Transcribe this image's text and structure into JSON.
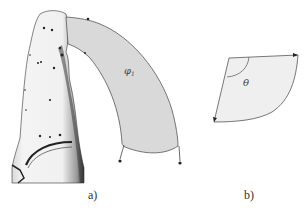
{
  "figure": {
    "panels": [
      {
        "id": "a",
        "caption": "a)",
        "region_label": "φ",
        "region_subscript": "1",
        "description": "3D finger scan with curved band region"
      },
      {
        "id": "b",
        "caption": "b)",
        "angle_label": "θ",
        "description": "circular sector parameterization"
      }
    ],
    "colors": {
      "region_fill": "#d9d9d9",
      "sector_fill": "#efefef",
      "stroke": "#555555",
      "finger": "#f2f2f2"
    }
  }
}
